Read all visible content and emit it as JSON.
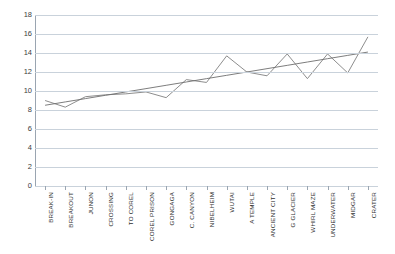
{
  "chart_data": {
    "type": "line",
    "title": "",
    "xlabel": "",
    "ylabel": "",
    "ylim": [
      0,
      18
    ],
    "ytick_step": 2,
    "yticks": [
      18,
      16,
      14,
      12,
      10,
      8,
      6,
      4,
      2,
      0
    ],
    "grid": "horizontal",
    "legend": "none",
    "categories": [
      "BREAK-IN",
      "BREAKOUT",
      "JUNON",
      "CROSSING",
      "TO COREL",
      "COREL PRISON",
      "GONGAGA",
      "C. CANYON",
      "NIBELHEIM",
      "WUTAI",
      "A TEMPLE",
      "ANCIENT CITY",
      "G GLACIER",
      "WHIRL MAZE",
      "UNDERWATER",
      "MIDGAR",
      "CRATER"
    ],
    "series": [
      {
        "name": "values",
        "color": "#808080",
        "values": [
          9.0,
          8.3,
          9.4,
          9.6,
          9.7,
          9.9,
          9.3,
          11.2,
          10.9,
          13.7,
          12.0,
          11.6,
          13.9,
          11.3,
          13.9,
          11.9,
          15.7
        ]
      },
      {
        "name": "trendline",
        "color": "#6e6e6e",
        "values": [
          8.5,
          8.85,
          9.2,
          9.55,
          9.9,
          10.25,
          10.6,
          10.95,
          11.3,
          11.65,
          12.0,
          12.35,
          12.7,
          13.05,
          13.4,
          13.75,
          14.1
        ]
      }
    ],
    "colors": {
      "grid": "#c9d2db",
      "axis": "#9aa5b1",
      "tick_text": "#3d3d3d",
      "background": "#ffffff"
    }
  }
}
